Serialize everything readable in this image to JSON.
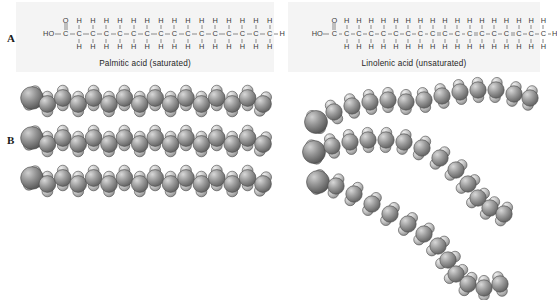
{
  "figure": {
    "panels": [
      {
        "letter": "A"
      },
      {
        "letter": "B"
      }
    ]
  },
  "panel_a": {
    "left": {
      "caption": "Palmitic acid (saturated)",
      "name": "Palmitic acid",
      "saturation": "saturated",
      "carbon_count": 16,
      "terminal_left_label": "HO",
      "terminal_right_label": "H",
      "carbonyl_oxygen_label": "O",
      "hydrogen_label": "H",
      "double_bond_positions": [],
      "top_hydrogens": [
        "H",
        "H",
        "H",
        "H",
        "H",
        "H",
        "H",
        "H",
        "H",
        "H",
        "H",
        "H",
        "H",
        "H"
      ],
      "bottom_hydrogens": [
        "H",
        "H",
        "H",
        "H",
        "H",
        "H",
        "H",
        "H",
        "H",
        "H",
        "H",
        "H",
        "H",
        "H"
      ]
    },
    "right": {
      "caption": "Linolenic acid (unsaturated)",
      "name": "Linolenic acid",
      "saturation": "unsaturated",
      "carbon_count": 18,
      "terminal_left_label": "HO",
      "terminal_right_label": "H",
      "carbonyl_oxygen_label": "O",
      "hydrogen_label": "H",
      "double_bond_positions": [
        9,
        12,
        15
      ]
    }
  },
  "panel_b": {
    "left": {
      "description": "Space-filling model of saturated fatty acid chains, straight and packed in parallel",
      "chain_count": 3,
      "shape": "straight"
    },
    "right": {
      "description": "Space-filling model of unsaturated fatty acid chains, kinked at cis double bonds",
      "chain_count": 3,
      "shape": "kinked"
    }
  },
  "colors": {
    "panel_background": "#f4f4f4",
    "page_background": "#ffffff",
    "bond_line": "#8a8a8a",
    "atom_text": "#3a3a3a",
    "caption_text": "#262626",
    "carbon_sphere": "#9a9a9a",
    "carbon_sphere_dark": "#6e6e6e",
    "hydrogen_sphere": "#c8c8c8",
    "oxygen_sphere": "#8d8d8d"
  }
}
